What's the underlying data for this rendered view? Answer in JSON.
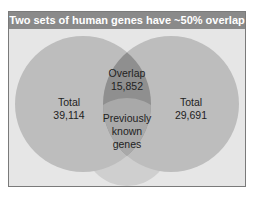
{
  "title": "Two sets of human genes have ~50% overlap",
  "colors": {
    "title_bg": "#8a8a8a",
    "frame_bg": "#e6e6e6",
    "left_circle": "#bdbdbd",
    "right_circle": "#bdbdbd",
    "overlap": "#8f8f8f",
    "known_circle": "#c9c9c9",
    "known_overlap": "#a6a6a6"
  },
  "sets": {
    "left": {
      "label": "Total",
      "value": "39,114"
    },
    "right": {
      "label": "Total",
      "value": "29,691"
    },
    "overlap": {
      "label": "Overlap",
      "value": "15,852"
    },
    "known": {
      "line1": "Previously",
      "line2": "known",
      "line3": "genes"
    }
  }
}
